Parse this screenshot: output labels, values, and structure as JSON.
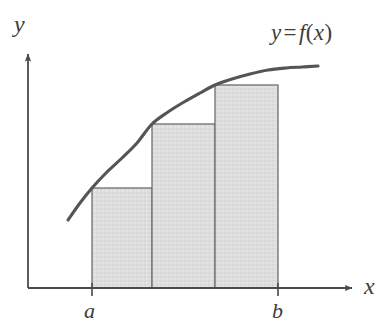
{
  "figure": {
    "background_color": "#ffffff",
    "axis_color": "#4a4a4a",
    "curve_color": "#555555",
    "rect_fill_color": "#dedede",
    "rect_stroke_color": "#6e6e6e",
    "labels": {
      "y_axis": "y",
      "x_axis": "x",
      "lower_limit": "a",
      "upper_limit": "b",
      "function_var": "y",
      "function_equals": "=",
      "function_name": "f",
      "function_open_paren": "(",
      "function_arg": "x",
      "function_close_paren": ")",
      "function_full": "y = f(x)"
    }
  },
  "chart_data": {
    "type": "area",
    "title": "",
    "subtitle": "",
    "xlabel": "x",
    "ylabel": "y",
    "grid": false,
    "legend": null,
    "annotations": [
      {
        "text": "y = f(x)",
        "x_px": 271,
        "y_px": 21
      },
      {
        "text": "a",
        "x_px": 84,
        "y_px": 300
      },
      {
        "text": "b",
        "x_px": 272,
        "y_px": 300
      }
    ],
    "axes": {
      "origin_px": {
        "x": 28,
        "y": 288
      },
      "x_axis_px": {
        "x1": 28,
        "y1": 288,
        "x2": 358,
        "y2": 288,
        "arrow": true
      },
      "y_axis_px": {
        "x1": 28,
        "y1": 288,
        "x2": 28,
        "y2": 48,
        "arrow": true
      },
      "ticks_x_px": [
        92,
        278
      ],
      "tick_labels_x": [
        "a",
        "b"
      ]
    },
    "curve": {
      "name": "f(x)",
      "description": "increasing concave-down curve",
      "points_px": [
        [
          68,
          220
        ],
        [
          80,
          203
        ],
        [
          92,
          188
        ],
        [
          106,
          173
        ],
        [
          122,
          158
        ],
        [
          137,
          143
        ],
        [
          152,
          124
        ],
        [
          168,
          112
        ],
        [
          184,
          102
        ],
        [
          200,
          93
        ],
        [
          215,
          85
        ],
        [
          232,
          79
        ],
        [
          250,
          74
        ],
        [
          268,
          70
        ],
        [
          286,
          68
        ],
        [
          302,
          67
        ],
        [
          318,
          66
        ]
      ]
    },
    "rectangles": [
      {
        "index": 1,
        "x_left_px": 92,
        "x_right_px": 152,
        "top_px": 188,
        "bottom_px": 288,
        "width_px": 60,
        "height_px": 100
      },
      {
        "index": 2,
        "x_left_px": 152,
        "x_right_px": 215,
        "top_px": 124,
        "bottom_px": 288,
        "width_px": 63,
        "height_px": 164
      },
      {
        "index": 3,
        "x_left_px": 215,
        "x_right_px": 278,
        "top_px": 85,
        "bottom_px": 288,
        "width_px": 63,
        "height_px": 203
      }
    ],
    "rectangle_count": 3,
    "sampling": "left-endpoint (inscribed, lower sum)"
  }
}
